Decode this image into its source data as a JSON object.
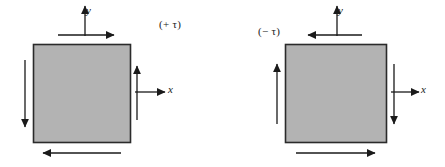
{
  "figure": {
    "background_color": "#ffffff",
    "square_fill_color": "#b3b3b3",
    "square_stroke_color": "#2b2b2b",
    "arrow_color": "#1a1a1a",
    "panels": [
      {
        "id": "positive-shear",
        "tau_label": "(+ τ)",
        "axis_x_label": "x",
        "axis_y_label": "y",
        "square": {
          "x": 33,
          "y": 44,
          "width": 97,
          "height": 98
        },
        "arrows": [
          {
            "name": "top-shear-arrow",
            "direction": "right",
            "edge": "top"
          },
          {
            "name": "bottom-shear-arrow",
            "direction": "left",
            "edge": "bottom"
          },
          {
            "name": "left-shear-arrow",
            "direction": "down",
            "edge": "left"
          },
          {
            "name": "right-shear-arrow",
            "direction": "up",
            "edge": "right"
          }
        ]
      },
      {
        "id": "negative-shear",
        "tau_label": "(− τ)",
        "axis_x_label": "x",
        "axis_y_label": "y",
        "square": {
          "x": 285,
          "y": 44,
          "width": 101,
          "height": 98
        },
        "arrows": [
          {
            "name": "top-shear-arrow",
            "direction": "left",
            "edge": "top"
          },
          {
            "name": "bottom-shear-arrow",
            "direction": "right",
            "edge": "bottom"
          },
          {
            "name": "left-shear-arrow",
            "direction": "up",
            "edge": "left"
          },
          {
            "name": "right-shear-arrow",
            "direction": "down",
            "edge": "right"
          }
        ]
      }
    ]
  }
}
